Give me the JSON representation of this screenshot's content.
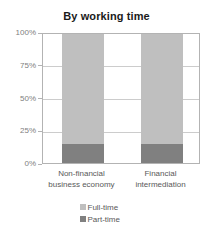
{
  "chart_data": {
    "type": "bar",
    "title": "By working time",
    "subtitle": "",
    "xlabel": "",
    "ylabel": "",
    "stacked": true,
    "grid": true,
    "legend_position": "bottom",
    "ylim": [
      0,
      100
    ],
    "ytick_labels": [
      "0%",
      "25%",
      "50%",
      "75%",
      "100%"
    ],
    "ytick_values": [
      0,
      25,
      50,
      75,
      100
    ],
    "categories": [
      "Non-financial business economy",
      "Financial intermediation"
    ],
    "category_lines": [
      [
        "Non-financial",
        "business economy"
      ],
      [
        "Financial",
        "intermediation"
      ]
    ],
    "series": [
      {
        "name": "Part-time",
        "values": [
          15,
          15
        ],
        "color": "#808080"
      },
      {
        "name": "Full-time",
        "values": [
          85,
          85
        ],
        "color": "#bfbfbf"
      }
    ],
    "legend": [
      {
        "label": "Full-time",
        "color": "#bfbfbf"
      },
      {
        "label": "Part-time",
        "color": "#808080"
      }
    ]
  },
  "colors": {
    "background": "#ffffff",
    "title": "#1a1a1a",
    "axis_line": "#b3b3b3",
    "gridline": "#cccccc",
    "tick_label": "#808080",
    "category_label": "#595959",
    "full_time": "#bfbfbf",
    "part_time": "#808080"
  }
}
